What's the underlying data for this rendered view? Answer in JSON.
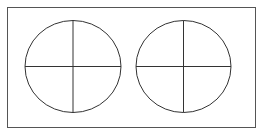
{
  "diagram": {
    "stroke_color": "#333333",
    "frame_color": "#555555",
    "background": "#ffffff",
    "frame": {
      "x": 7.5,
      "y": 7.5,
      "width": 248,
      "height": 120
    },
    "shapes": [
      {
        "name": "left-circle",
        "cx": 73,
        "cy": 66.5,
        "rx": 48,
        "ry": 46,
        "divisions": 4
      },
      {
        "name": "right-circle",
        "cx": 183.5,
        "cy": 66.5,
        "rx": 47.5,
        "ry": 46,
        "divisions": 4
      }
    ]
  }
}
